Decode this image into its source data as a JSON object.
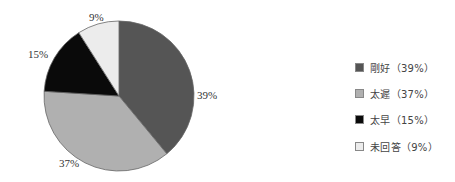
{
  "chart_data": {
    "type": "pie",
    "title": "",
    "categories": [
      "剛好",
      "太遲",
      "太早",
      "未回答"
    ],
    "values": [
      39,
      37,
      15,
      9
    ],
    "unit": "%",
    "colors": [
      "#555555",
      "#b0b0b0",
      "#0a0a0a",
      "#ececec"
    ],
    "start_angle_deg": 0,
    "direction": "clockwise from 12 o'clock",
    "data_labels": [
      "39%",
      "37%",
      "15%",
      "9%"
    ],
    "legend_position": "right",
    "legend_labels": [
      "剛好（39%）",
      "太遲（37%）",
      "太早（15%）",
      "未回答（9%）"
    ]
  },
  "labels": {
    "slice0": "39%",
    "slice1": "37%",
    "slice2": "15%",
    "slice3": "9%"
  },
  "legend": {
    "items": [
      {
        "label": "剛好（39%）",
        "color": "#555555"
      },
      {
        "label": "太遲（37%）",
        "color": "#b0b0b0"
      },
      {
        "label": "太早（15%）",
        "color": "#0a0a0a"
      },
      {
        "label": "未回答（9%）",
        "color": "#ececec"
      }
    ]
  }
}
